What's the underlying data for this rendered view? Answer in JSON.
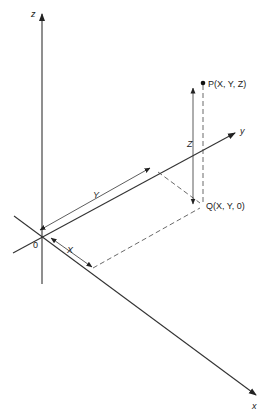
{
  "diagram": {
    "type": "3D Cartesian coordinate system",
    "axes": {
      "z_label": "z",
      "y_label": "y",
      "x_label": "x"
    },
    "origin_label": "0",
    "points": {
      "P": {
        "label": "P(X, Y, Z)"
      },
      "Q": {
        "label": "Q(X, Y, 0)"
      }
    },
    "dimensions": {
      "X": "X",
      "Y": "Y",
      "Z": "Z"
    },
    "colors": {
      "line": "#333333",
      "background": "#ffffff"
    }
  }
}
